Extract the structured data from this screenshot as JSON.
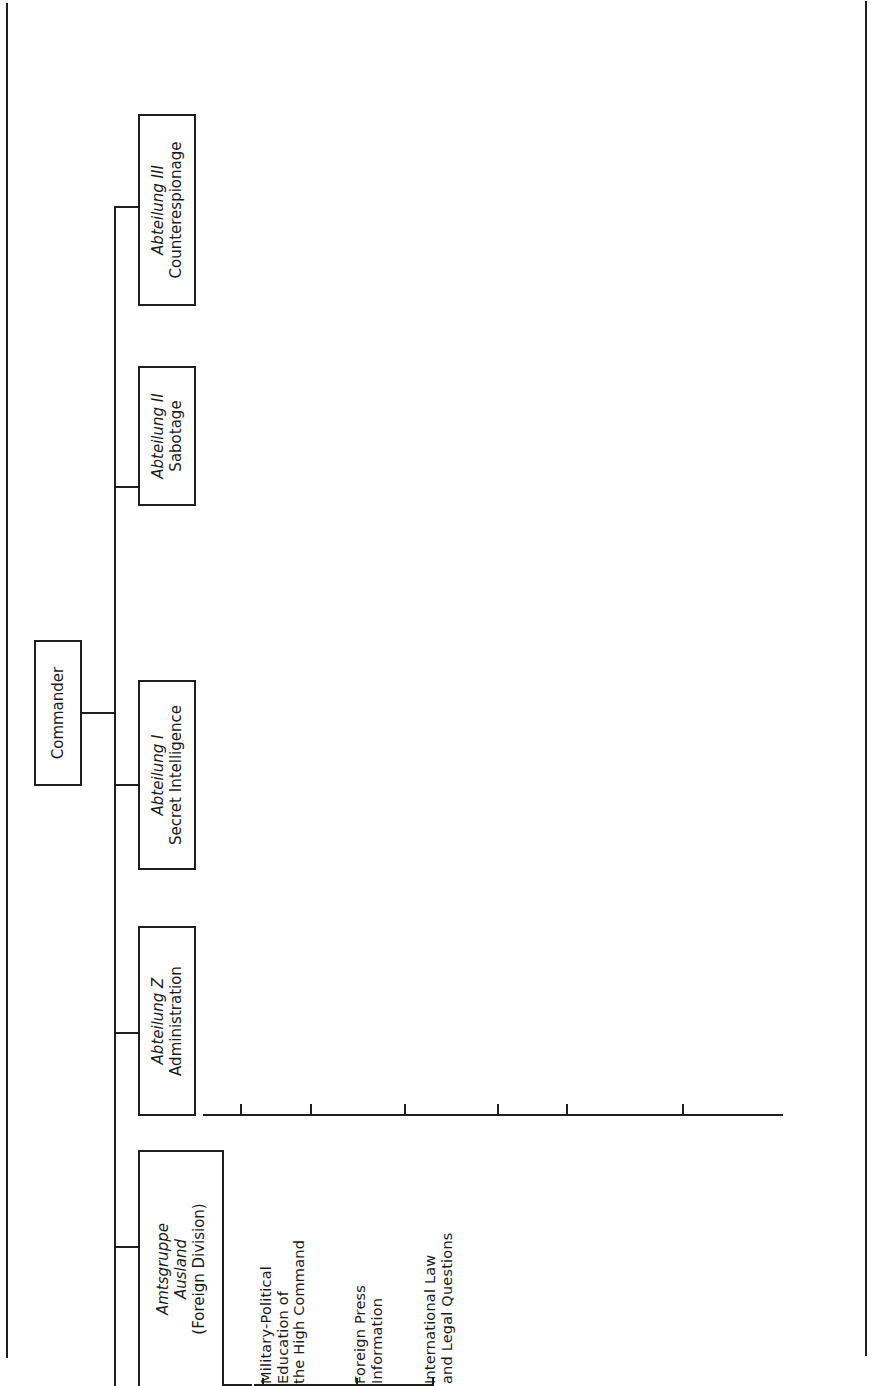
{
  "root": {
    "label": "Commander"
  },
  "divisions": [
    {
      "name": "Amtsgruppe Ausland",
      "subtitle": "(Foreign Division)",
      "italic_lines": [
        "Amtsgruppe",
        "Ausland"
      ],
      "units": [
        {
          "code": "",
          "text": "Military-Political\nEducation of\nthe High Command"
        },
        {
          "code": "",
          "text": "Foreign Press\nInformation"
        },
        {
          "code": "",
          "text": "International Law\nand Legal Questions"
        }
      ]
    },
    {
      "name": "Abteilung Z",
      "subtitle": "Administration",
      "units": [
        {
          "code": "Z ARCH",
          "text": "Records"
        },
        {
          "code": "ZK   Zk",
          "text": "Central Card\nIndex"
        },
        {
          "code": "ZKV   ZkV",
          "text": "Agents' Central\nCard Index"
        },
        {
          "code": "Z REG",
          "text": "Filing"
        },
        {
          "code": "ZB",
          "text": "Foreign\nPolicy\nReports"
        },
        {
          "code": "ZO",
          "text": "Officers\nPersonal\nRecords"
        }
      ],
      "sub_branch": [
        {
          "code": "ZR",
          "text": "Legal"
        },
        {
          "code": "ZF",
          "text": "Finance"
        }
      ]
    },
    {
      "name": "Abteilung I",
      "subtitle": "Secret Intelligence",
      "units_lower": [
        {
          "code": "IZ",
          "text": "Central Office"
        },
        {
          "code": "IH West",
          "text": "Western\nIntelligence"
        },
        {
          "code": "IH East",
          "text": "Eastern\nIntelligence"
        },
        {
          "code": "IM Naval",
          "text": "Intelligence"
        },
        {
          "code": "IL",
          "text": "Air Intelligence"
        },
        {
          "code": "IT",
          "text": "Technical\nIntelligence"
        }
      ],
      "units_upper": [
        {
          "code": "ITLW",
          "text": "Air Force\nTechnical\nIntelligence"
        },
        {
          "code": "IWI",
          "text": "Industrial\nIntelligence"
        },
        {
          "code": "IKO",
          "text": "Liaison with\nNetworks Abroad"
        },
        {
          "code": "IG",
          "text": "Laboratories"
        },
        {
          "code": "II",
          "text": "Agents' Radio\nNetworks and\nCommunications"
        }
      ]
    },
    {
      "name": "Abteilung II",
      "subtitle": "Sabotage",
      "units": [
        {
          "code": "II A",
          "text": "Central Office"
        },
        {
          "code": "",
          "text": "West"
        },
        {
          "code": "",
          "text": "East"
        },
        {
          "code": "",
          "text": "Southeast"
        },
        {
          "code": "",
          "text": "Overseas"
        },
        {
          "code": "",
          "text": "Technical"
        }
      ]
    },
    {
      "name": "Abteilung III",
      "subtitle": "Counterespionage",
      "units_lower": [
        {
          "code": "III A",
          "text": "Staff\nand\nAdministration"
        },
        {
          "code": "III C",
          "text": "Military\nSecurity,\nLiaison with\nRSHA"
        },
        {
          "code": "III U",
          "text": "Internal\nEvaluation"
        },
        {
          "code": "III W",
          "text": "Counter-\nespionage\nin Armed\nForces"
        }
      ],
      "units_upper": [
        {
          "code": "III N",
          "text": "Liaison\nwith Press,\nCinema,\nPostal\nAuthorities,\nCensorship"
        },
        {
          "code": "III D",
          "text": "Disinformation"
        },
        {
          "code": "III KGF",
          "text": "Security in\nPOW\nCamps"
        },
        {
          "code": "III G",
          "text": "Assessment\nof\nTreasonable\nActs"
        },
        {
          "code": "III F",
          "text": "Counter-\nintelligence"
        }
      ]
    }
  ]
}
